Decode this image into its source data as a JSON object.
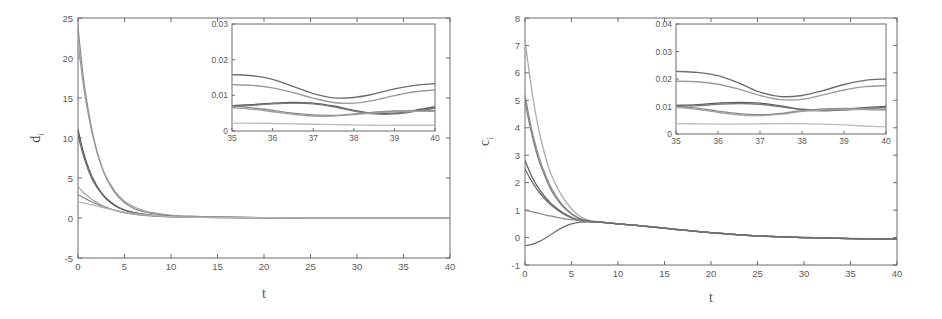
{
  "figure": {
    "background": "#ffffff",
    "panel_count": 2,
    "style": "grayscale-scanned-matlab-figure"
  },
  "chart_data": [
    {
      "id": "panel-left",
      "type": "line",
      "title": "",
      "xlabel": "t",
      "ylabel": "d_i",
      "ylabel_display": "d",
      "ylabel_subscript": "i",
      "xlim": [
        0,
        40
      ],
      "ylim": [
        -5,
        25
      ],
      "xticks": [
        0,
        5,
        10,
        15,
        20,
        25,
        30,
        35,
        40
      ],
      "xticklabels": [
        "0",
        "5",
        "10",
        "15",
        "20",
        "25",
        "30",
        "35",
        "40"
      ],
      "yticks": [
        -5,
        0,
        5,
        10,
        15,
        20,
        25
      ],
      "yticklabels": [
        "-5",
        "0",
        "5",
        "10",
        "15",
        "20",
        "25"
      ],
      "grid": false,
      "legend": "none",
      "x": [
        0,
        0.25,
        0.5,
        0.75,
        1,
        1.5,
        2,
        2.5,
        3,
        4,
        5,
        6,
        7,
        8,
        10,
        12,
        15,
        20,
        25,
        30,
        35,
        40
      ],
      "series": [
        {
          "name": "d1",
          "color": "#8e8e8e",
          "values": [
            24.0,
            21.0,
            18.3,
            16.1,
            14.2,
            11.0,
            8.5,
            6.6,
            5.1,
            3.1,
            1.9,
            1.2,
            0.8,
            0.55,
            0.3,
            0.2,
            0.12,
            0.05,
            0.02,
            0.015,
            0.016,
            0.013
          ]
        },
        {
          "name": "d2",
          "color": "#9b9b9b",
          "values": [
            22.2,
            19.6,
            17.3,
            15.3,
            13.6,
            10.7,
            8.4,
            6.6,
            5.2,
            3.3,
            2.1,
            1.4,
            0.95,
            0.66,
            0.34,
            0.22,
            0.13,
            0.055,
            0.022,
            0.016,
            0.013,
            0.011
          ]
        },
        {
          "name": "d3",
          "color": "#5b5b5b",
          "values": [
            11.1,
            9.8,
            8.6,
            7.6,
            6.7,
            5.2,
            4.1,
            3.2,
            2.5,
            1.6,
            1.0,
            0.68,
            0.47,
            0.34,
            0.19,
            0.12,
            0.075,
            0.035,
            0.015,
            0.009,
            0.007,
            0.008
          ]
        },
        {
          "name": "d4",
          "color": "#6a6a6a",
          "values": [
            10.4,
            9.2,
            8.1,
            7.2,
            6.3,
            4.9,
            3.9,
            3.1,
            2.4,
            1.5,
            0.98,
            0.66,
            0.46,
            0.33,
            0.19,
            0.12,
            0.073,
            0.034,
            0.015,
            0.008,
            0.0068,
            0.0055
          ]
        },
        {
          "name": "d5",
          "color": "#a5a5a5",
          "values": [
            3.9,
            3.6,
            3.3,
            3.0,
            2.8,
            2.3,
            1.95,
            1.62,
            1.36,
            0.95,
            0.66,
            0.47,
            0.34,
            0.25,
            0.145,
            0.095,
            0.058,
            0.028,
            0.012,
            0.007,
            0.0072,
            0.0065
          ]
        },
        {
          "name": "d6",
          "color": "#8a8a8a",
          "values": [
            2.9,
            2.75,
            2.6,
            2.45,
            2.3,
            2.0,
            1.75,
            1.5,
            1.3,
            0.94,
            0.67,
            0.48,
            0.35,
            0.26,
            0.15,
            0.098,
            0.06,
            0.029,
            0.013,
            0.0075,
            0.0062,
            0.006
          ]
        },
        {
          "name": "d7",
          "color": "#b4b4b4",
          "values": [
            2.0,
            1.95,
            1.9,
            1.84,
            1.78,
            1.64,
            1.5,
            1.36,
            1.22,
            0.97,
            0.74,
            0.56,
            0.42,
            0.32,
            0.185,
            0.12,
            0.07,
            0.032,
            0.013,
            0.005,
            0.0022,
            0.0017
          ]
        }
      ],
      "inset": {
        "xlim": [
          35,
          40
        ],
        "ylim": [
          0,
          0.03
        ],
        "xticks": [
          35,
          36,
          37,
          38,
          39,
          40
        ],
        "xticklabels": [
          "35",
          "36",
          "37",
          "38",
          "39",
          "40"
        ],
        "yticks": [
          0,
          0.01,
          0.02,
          0.03
        ],
        "yticklabels": [
          "0",
          "0.01",
          "0.02",
          "0.03"
        ],
        "x": [
          35,
          35.5,
          36,
          36.5,
          37,
          37.5,
          38,
          38.5,
          39,
          39.5,
          40
        ],
        "series": [
          {
            "name": "d1",
            "color": "#6d6d6d",
            "values": [
              0.0158,
              0.0155,
              0.0145,
              0.0125,
              0.0105,
              0.0093,
              0.0094,
              0.0104,
              0.0118,
              0.0128,
              0.0133
            ]
          },
          {
            "name": "d2",
            "color": "#9b9b9b",
            "values": [
              0.013,
              0.0128,
              0.0121,
              0.0108,
              0.0092,
              0.008,
              0.0078,
              0.0086,
              0.0099,
              0.011,
              0.0115
            ]
          },
          {
            "name": "d3",
            "color": "#5b5b5b",
            "values": [
              0.0071,
              0.0074,
              0.0078,
              0.008,
              0.0078,
              0.007,
              0.0058,
              0.005,
              0.005,
              0.0058,
              0.0068
            ]
          },
          {
            "name": "d4",
            "color": "#767676",
            "values": [
              0.0068,
              0.0072,
              0.0076,
              0.0078,
              0.0076,
              0.0068,
              0.0056,
              0.0048,
              0.0048,
              0.0055,
              0.0064
            ]
          },
          {
            "name": "d5",
            "color": "#8a8a8a",
            "values": [
              0.007,
              0.0065,
              0.0058,
              0.005,
              0.0045,
              0.0044,
              0.0048,
              0.0053,
              0.0056,
              0.0057,
              0.0057
            ]
          },
          {
            "name": "d6",
            "color": "#9f9f9f",
            "values": [
              0.0066,
              0.0061,
              0.0054,
              0.0047,
              0.0042,
              0.0042,
              0.0046,
              0.0051,
              0.0054,
              0.0055,
              0.0055
            ]
          },
          {
            "name": "d7",
            "color": "#bdbdbd",
            "values": [
              0.0022,
              0.0022,
              0.0021,
              0.002,
              0.0019,
              0.0018,
              0.0017,
              0.0016,
              0.0016,
              0.0016,
              0.0016
            ]
          }
        ]
      }
    },
    {
      "id": "panel-right",
      "type": "line",
      "title": "",
      "xlabel": "t",
      "ylabel": "c_i",
      "ylabel_display": "c",
      "ylabel_subscript": "i",
      "xlim": [
        0,
        40
      ],
      "ylim": [
        -1,
        8
      ],
      "xticks": [
        0,
        5,
        10,
        15,
        20,
        25,
        30,
        35,
        40
      ],
      "xticklabels": [
        "0",
        "5",
        "10",
        "15",
        "20",
        "25",
        "30",
        "35",
        "40"
      ],
      "yticks": [
        -1,
        0,
        1,
        2,
        3,
        4,
        5,
        6,
        7,
        8
      ],
      "yticklabels": [
        "-1",
        "0",
        "1",
        "2",
        "3",
        "4",
        "5",
        "6",
        "7",
        "8"
      ],
      "grid": false,
      "legend": "none",
      "x": [
        0,
        0.5,
        1,
        1.5,
        2,
        2.5,
        3,
        4,
        5,
        6,
        7,
        8,
        10,
        12,
        15,
        20,
        25,
        30,
        35,
        40
      ],
      "series": [
        {
          "name": "c1",
          "color": "#a8a8a8",
          "values": [
            7.2,
            5.9,
            4.8,
            3.9,
            3.2,
            2.6,
            2.15,
            1.5,
            1.05,
            0.75,
            0.62,
            0.58,
            0.5,
            0.43,
            0.33,
            0.17,
            0.05,
            0.0,
            -0.04,
            -0.06
          ]
        },
        {
          "name": "c2",
          "color": "#8f8f8f",
          "values": [
            5.2,
            4.3,
            3.55,
            2.95,
            2.45,
            2.05,
            1.7,
            1.2,
            0.88,
            0.68,
            0.6,
            0.57,
            0.5,
            0.44,
            0.34,
            0.18,
            0.06,
            0.005,
            -0.035,
            -0.055
          ]
        },
        {
          "name": "c3",
          "color": "#7d7d7d",
          "values": [
            5.0,
            4.1,
            3.4,
            2.8,
            2.35,
            1.95,
            1.62,
            1.16,
            0.86,
            0.67,
            0.6,
            0.57,
            0.5,
            0.44,
            0.34,
            0.18,
            0.06,
            0.005,
            -0.03,
            -0.05
          ]
        },
        {
          "name": "c4",
          "color": "#5e5e5e",
          "values": [
            2.8,
            2.4,
            2.05,
            1.78,
            1.55,
            1.35,
            1.18,
            0.92,
            0.74,
            0.63,
            0.58,
            0.56,
            0.5,
            0.44,
            0.34,
            0.18,
            0.06,
            0.0,
            -0.04,
            -0.06
          ]
        },
        {
          "name": "c5",
          "color": "#6b6b6b",
          "values": [
            2.5,
            2.18,
            1.9,
            1.66,
            1.46,
            1.28,
            1.13,
            0.89,
            0.72,
            0.62,
            0.58,
            0.56,
            0.5,
            0.44,
            0.34,
            0.18,
            0.06,
            0.0,
            -0.04,
            -0.06
          ]
        },
        {
          "name": "c6",
          "color": "#888888",
          "values": [
            1.0,
            0.96,
            0.92,
            0.88,
            0.84,
            0.8,
            0.77,
            0.7,
            0.65,
            0.61,
            0.58,
            0.56,
            0.5,
            0.44,
            0.34,
            0.18,
            0.06,
            0.0,
            -0.04,
            -0.06
          ]
        },
        {
          "name": "c7",
          "color": "#6d6d6d",
          "values": [
            -0.3,
            -0.27,
            -0.22,
            -0.15,
            -0.06,
            0.05,
            0.16,
            0.36,
            0.5,
            0.56,
            0.57,
            0.56,
            0.5,
            0.44,
            0.34,
            0.18,
            0.06,
            0.0,
            -0.04,
            -0.06
          ]
        }
      ],
      "inset": {
        "xlim": [
          35,
          40
        ],
        "ylim": [
          0,
          0.04
        ],
        "xticks": [
          35,
          36,
          37,
          38,
          39,
          40
        ],
        "xticklabels": [
          "35",
          "36",
          "37",
          "38",
          "39",
          "40"
        ],
        "yticks": [
          0,
          0.01,
          0.02,
          0.03,
          0.04
        ],
        "yticklabels": [
          "0",
          "0.01",
          "0.02",
          "0.03",
          "0.04"
        ],
        "x": [
          35,
          35.5,
          36,
          36.5,
          37,
          37.5,
          38,
          38.5,
          39,
          39.5,
          40
        ],
        "series": [
          {
            "name": "c1",
            "color": "#6d6d6d",
            "values": [
              0.0228,
              0.0224,
              0.0212,
              0.0185,
              0.0152,
              0.0136,
              0.014,
              0.0158,
              0.018,
              0.0195,
              0.02
            ]
          },
          {
            "name": "c2",
            "color": "#9b9b9b",
            "values": [
              0.0192,
              0.019,
              0.0181,
              0.0163,
              0.014,
              0.0125,
              0.0126,
              0.0142,
              0.016,
              0.0172,
              0.0176
            ]
          },
          {
            "name": "c3",
            "color": "#5e5e5e",
            "values": [
              0.0104,
              0.0107,
              0.0112,
              0.0115,
              0.0112,
              0.0102,
              0.009,
              0.0086,
              0.009,
              0.0096,
              0.01
            ]
          },
          {
            "name": "c4",
            "color": "#787878",
            "values": [
              0.01,
              0.0103,
              0.0108,
              0.0111,
              0.0108,
              0.0099,
              0.0088,
              0.0084,
              0.0087,
              0.0093,
              0.0097
            ]
          },
          {
            "name": "c5",
            "color": "#8a8a8a",
            "values": [
              0.0101,
              0.0094,
              0.0083,
              0.0074,
              0.007,
              0.0075,
              0.0085,
              0.0091,
              0.0093,
              0.0092,
              0.009
            ]
          },
          {
            "name": "c6",
            "color": "#9f9f9f",
            "values": [
              0.0097,
              0.009,
              0.0079,
              0.007,
              0.0067,
              0.0072,
              0.0082,
              0.0088,
              0.009,
              0.0089,
              0.0087
            ]
          },
          {
            "name": "c7",
            "color": "#bdbdbd",
            "values": [
              0.0038,
              0.0037,
              0.0036,
              0.0036,
              0.0037,
              0.0038,
              0.0038,
              0.0036,
              0.0033,
              0.0029,
              0.0026
            ]
          }
        ]
      }
    }
  ]
}
